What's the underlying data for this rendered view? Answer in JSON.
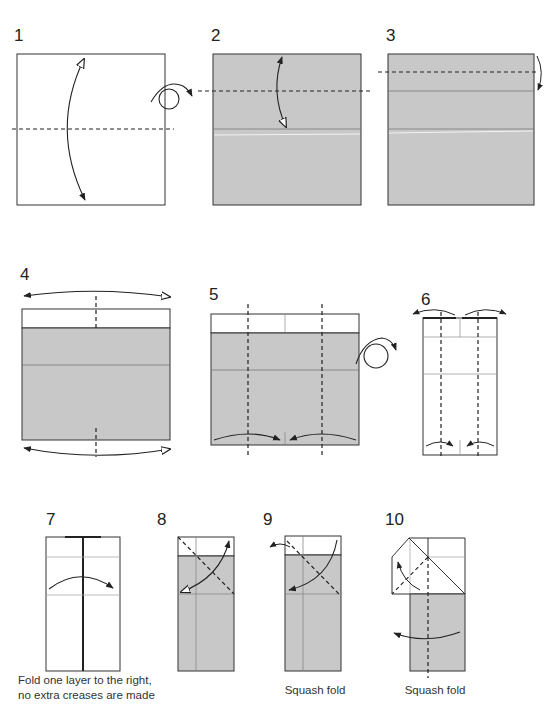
{
  "diagram": {
    "kind": "origami folding instructions",
    "colors": {
      "paper_colored": "#c8c8c8",
      "paper_white": "#ffffff",
      "outline": "#333333",
      "crease": "#8a8a8a",
      "highlight": "#ececec"
    },
    "steps": [
      {
        "number": "1",
        "caption": "",
        "symbols": [
          "valley-fold-line-horizontal",
          "fold-unfold-arrow",
          "turn-over-icon"
        ]
      },
      {
        "number": "2",
        "caption": "",
        "symbols": [
          "valley-fold-line-horizontal",
          "fold-unfold-arrow"
        ]
      },
      {
        "number": "3",
        "caption": "",
        "symbols": [
          "valley-fold-line-horizontal",
          "fold-arrow-behind"
        ]
      },
      {
        "number": "4",
        "caption": "",
        "symbols": [
          "valley-fold-line-vertical",
          "fold-unfold-arrows-left-right"
        ]
      },
      {
        "number": "5",
        "caption": "",
        "symbols": [
          "valley-fold-lines-vertical",
          "fold-arrows-to-center",
          "turn-over-icon"
        ]
      },
      {
        "number": "6",
        "caption": "",
        "symbols": [
          "valley-fold-lines-vertical",
          "unfold-arrows-outward",
          "fold-arrows-to-center"
        ]
      },
      {
        "number": "7",
        "caption_line1": "Fold one layer to the right,",
        "caption_line2": "no extra creases are made",
        "symbols": [
          "fold-arrow-right"
        ]
      },
      {
        "number": "8",
        "caption": "",
        "symbols": [
          "valley-fold-line-diagonal",
          "fold-unfold-arrow"
        ]
      },
      {
        "number": "9",
        "caption": "Squash fold",
        "symbols": [
          "valley-fold-line-diagonal",
          "squash-arrow",
          "open-arrow"
        ]
      },
      {
        "number": "10",
        "caption": "Squash fold",
        "symbols": [
          "valley-fold-line-diagonal",
          "valley-fold-line-vertical",
          "fold-arrow-left"
        ]
      }
    ]
  }
}
